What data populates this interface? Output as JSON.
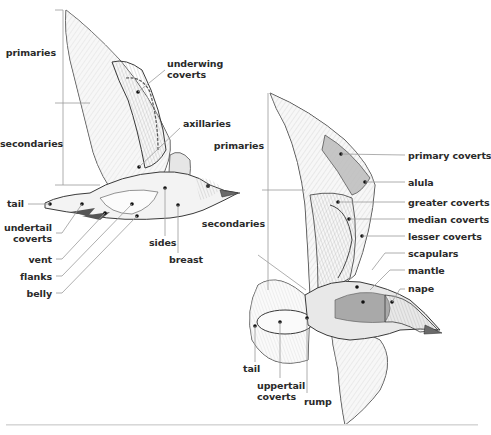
{
  "diagram": {
    "type": "labeled-illustration",
    "figures": [
      {
        "name": "underside-view",
        "labels": [
          {
            "id": "primaries",
            "text": "primaries"
          },
          {
            "id": "underwing_coverts",
            "text": "underwing\ncoverts",
            "lines": [
              "underwing",
              "coverts"
            ]
          },
          {
            "id": "axillaries",
            "text": "axillaries"
          },
          {
            "id": "secondaries",
            "text": "secondaries"
          },
          {
            "id": "tail",
            "text": "tail"
          },
          {
            "id": "undertail_coverts",
            "lines": [
              "undertail",
              "coverts"
            ]
          },
          {
            "id": "vent",
            "text": "vent"
          },
          {
            "id": "flanks",
            "text": "flanks"
          },
          {
            "id": "belly",
            "text": "belly"
          },
          {
            "id": "sides",
            "text": "sides"
          },
          {
            "id": "breast",
            "text": "breast"
          }
        ]
      },
      {
        "name": "upperside-view",
        "labels": [
          {
            "id": "primaries",
            "text": "primaries"
          },
          {
            "id": "secondaries",
            "text": "secondaries"
          },
          {
            "id": "primary_coverts",
            "text": "primary coverts"
          },
          {
            "id": "alula",
            "text": "alula"
          },
          {
            "id": "greater_coverts",
            "text": "greater coverts"
          },
          {
            "id": "median_coverts",
            "text": "median coverts"
          },
          {
            "id": "lesser_coverts",
            "text": "lesser coverts"
          },
          {
            "id": "scapulars",
            "text": "scapulars"
          },
          {
            "id": "mantle",
            "text": "mantle"
          },
          {
            "id": "nape",
            "text": "nape"
          },
          {
            "id": "tail",
            "text": "tail"
          },
          {
            "id": "uppertail_coverts",
            "lines": [
              "uppertail",
              "coverts"
            ]
          },
          {
            "id": "rump",
            "text": "rump"
          }
        ]
      }
    ]
  },
  "left": {
    "primaries": "primaries",
    "underwing_1": "underwing",
    "underwing_2": "coverts",
    "axillaries": "axillaries",
    "secondaries": "secondaries",
    "tail": "tail",
    "undertail_1": "undertail",
    "undertail_2": "coverts",
    "vent": "vent",
    "flanks": "flanks",
    "belly": "belly",
    "sides": "sides",
    "breast": "breast"
  },
  "right": {
    "primaries": "primaries",
    "secondaries": "secondaries",
    "primary_coverts": "primary coverts",
    "alula": "alula",
    "greater_coverts": "greater coverts",
    "median_coverts": "median coverts",
    "lesser_coverts": "lesser coverts",
    "scapulars": "scapulars",
    "mantle": "mantle",
    "nape": "nape",
    "tail": "tail",
    "uppertail_1": "uppertail",
    "uppertail_2": "coverts",
    "rump": "rump"
  },
  "colors": {
    "label_text": "#2a2a2a",
    "leader_line": "#9a9a9a",
    "outline": "#3a3a3a",
    "feather_light": "#ececec",
    "feather_mid": "#cfcfcf",
    "feather_dark": "#9d9d9d",
    "mantle_gray": "#a9a9a9",
    "footer_rule": "#d0d0d0"
  }
}
